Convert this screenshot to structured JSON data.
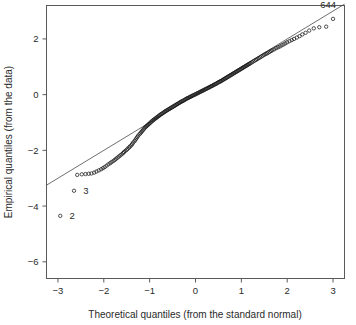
{
  "chart_data": {
    "type": "scatter",
    "title": "",
    "subtitle": "",
    "xlabel": "Theoretical quantiles (from the standard normal)",
    "ylabel": "Empirical quantiles (from the data)",
    "xlim": [
      -3.25,
      3.25
    ],
    "ylim": [
      -6.6,
      3.2
    ],
    "xticks": [
      -3,
      -2,
      -1,
      0,
      1,
      2,
      3
    ],
    "xtick_labels": [
      "-3",
      "-2",
      "-1",
      "0",
      "1",
      "2",
      "3"
    ],
    "yticks": [
      2,
      0,
      -2,
      -4,
      -6
    ],
    "ytick_labels": [
      "2",
      "0",
      "-2",
      "-4",
      "-6"
    ],
    "grid": false,
    "legend": null,
    "marker": "open-circle",
    "reference_line": {
      "type": "qq-line",
      "slope": 1.0,
      "intercept": 0.0,
      "x_from": -3.25,
      "x_to": 3.25,
      "y_from": -3.25,
      "y_to": 3.25
    },
    "annotations": [
      {
        "label": "644",
        "x": 3.0,
        "y": 2.72,
        "dx": -0.28,
        "dy": 0.52
      },
      {
        "label": "3",
        "x": -2.65,
        "y": -3.45,
        "dx": 0.2,
        "dy": 0.0
      },
      {
        "label": "2",
        "x": -2.95,
        "y": -4.35,
        "dx": 0.2,
        "dy": 0.0
      }
    ],
    "series": [
      {
        "name": "sample quantiles",
        "x": [
          -2.95,
          -2.65,
          -2.58,
          -2.48,
          -2.4,
          -2.33,
          -2.27,
          -2.21,
          -2.16,
          -2.11,
          -2.06,
          -2.02,
          -1.98,
          -1.94,
          -1.9,
          -1.86,
          -1.83,
          -1.79,
          -1.76,
          -1.73,
          -1.7,
          -1.67,
          -1.64,
          -1.61,
          -1.58,
          -1.56,
          -1.53,
          -1.5,
          -1.48,
          -1.45,
          -1.43,
          -1.4,
          -1.38,
          -1.36,
          -1.33,
          -1.31,
          -1.29,
          -1.27,
          -1.25,
          -1.22,
          -1.2,
          -1.18,
          -1.16,
          -1.14,
          -1.12,
          -1.1,
          -1.08,
          -1.06,
          -1.04,
          -1.02,
          -1.0,
          -0.98,
          -0.96,
          -0.94,
          -0.92,
          -0.9,
          -0.88,
          -0.86,
          -0.84,
          -0.82,
          -0.8,
          -0.78,
          -0.76,
          -0.74,
          -0.72,
          -0.7,
          -0.68,
          -0.66,
          -0.64,
          -0.62,
          -0.6,
          -0.58,
          -0.56,
          -0.54,
          -0.52,
          -0.5,
          -0.48,
          -0.46,
          -0.44,
          -0.42,
          -0.4,
          -0.38,
          -0.36,
          -0.34,
          -0.32,
          -0.3,
          -0.28,
          -0.26,
          -0.24,
          -0.22,
          -0.2,
          -0.18,
          -0.16,
          -0.14,
          -0.12,
          -0.1,
          -0.08,
          -0.06,
          -0.04,
          -0.02,
          0.0,
          0.02,
          0.04,
          0.06,
          0.08,
          0.1,
          0.12,
          0.14,
          0.16,
          0.18,
          0.2,
          0.22,
          0.24,
          0.26,
          0.28,
          0.3,
          0.32,
          0.34,
          0.36,
          0.38,
          0.4,
          0.42,
          0.44,
          0.46,
          0.48,
          0.5,
          0.52,
          0.54,
          0.56,
          0.58,
          0.6,
          0.62,
          0.64,
          0.66,
          0.68,
          0.7,
          0.72,
          0.74,
          0.76,
          0.78,
          0.8,
          0.82,
          0.84,
          0.86,
          0.88,
          0.9,
          0.92,
          0.94,
          0.96,
          0.98,
          1.0,
          1.02,
          1.04,
          1.06,
          1.08,
          1.1,
          1.12,
          1.14,
          1.16,
          1.18,
          1.2,
          1.23,
          1.26,
          1.29,
          1.32,
          1.35,
          1.38,
          1.41,
          1.44,
          1.47,
          1.5,
          1.53,
          1.56,
          1.59,
          1.62,
          1.65,
          1.68,
          1.72,
          1.76,
          1.8,
          1.84,
          1.88,
          1.92,
          1.96,
          2.0,
          2.05,
          2.1,
          2.15,
          2.21,
          2.27,
          2.33,
          2.4,
          2.48,
          2.58,
          2.7,
          2.85,
          3.0
        ],
        "y": [
          -4.35,
          -3.45,
          -2.88,
          -2.86,
          -2.85,
          -2.84,
          -2.83,
          -2.8,
          -2.76,
          -2.72,
          -2.68,
          -2.64,
          -2.6,
          -2.55,
          -2.5,
          -2.46,
          -2.42,
          -2.38,
          -2.34,
          -2.3,
          -2.26,
          -2.22,
          -2.18,
          -2.14,
          -2.1,
          -2.06,
          -2.02,
          -1.98,
          -1.94,
          -1.9,
          -1.86,
          -1.82,
          -1.77,
          -1.72,
          -1.67,
          -1.62,
          -1.57,
          -1.52,
          -1.47,
          -1.42,
          -1.38,
          -1.34,
          -1.3,
          -1.26,
          -1.22,
          -1.18,
          -1.15,
          -1.12,
          -1.09,
          -1.06,
          -1.03,
          -1.0,
          -0.97,
          -0.94,
          -0.91,
          -0.89,
          -0.86,
          -0.84,
          -0.81,
          -0.79,
          -0.76,
          -0.74,
          -0.71,
          -0.69,
          -0.67,
          -0.65,
          -0.62,
          -0.6,
          -0.58,
          -0.56,
          -0.54,
          -0.52,
          -0.5,
          -0.48,
          -0.46,
          -0.44,
          -0.42,
          -0.4,
          -0.38,
          -0.36,
          -0.34,
          -0.32,
          -0.3,
          -0.28,
          -0.26,
          -0.24,
          -0.23,
          -0.21,
          -0.19,
          -0.17,
          -0.15,
          -0.13,
          -0.12,
          -0.1,
          -0.08,
          -0.07,
          -0.05,
          -0.03,
          -0.02,
          0.0,
          0.01,
          0.03,
          0.05,
          0.06,
          0.08,
          0.1,
          0.11,
          0.13,
          0.15,
          0.16,
          0.18,
          0.2,
          0.21,
          0.23,
          0.25,
          0.26,
          0.28,
          0.3,
          0.31,
          0.33,
          0.35,
          0.37,
          0.38,
          0.4,
          0.42,
          0.44,
          0.46,
          0.47,
          0.49,
          0.51,
          0.53,
          0.55,
          0.57,
          0.59,
          0.61,
          0.63,
          0.65,
          0.67,
          0.69,
          0.71,
          0.73,
          0.75,
          0.77,
          0.79,
          0.81,
          0.83,
          0.85,
          0.87,
          0.89,
          0.91,
          0.93,
          0.95,
          0.97,
          0.99,
          1.01,
          1.03,
          1.05,
          1.07,
          1.09,
          1.11,
          1.13,
          1.16,
          1.19,
          1.22,
          1.25,
          1.28,
          1.31,
          1.34,
          1.37,
          1.4,
          1.43,
          1.46,
          1.48,
          1.51,
          1.54,
          1.57,
          1.6,
          1.63,
          1.67,
          1.7,
          1.73,
          1.77,
          1.8,
          1.84,
          1.88,
          1.92,
          1.96,
          2.0,
          2.05,
          2.1,
          2.16,
          2.22,
          2.3,
          2.38,
          2.42,
          2.44,
          2.72
        ]
      }
    ]
  }
}
